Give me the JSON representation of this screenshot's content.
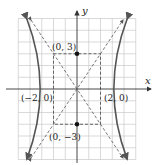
{
  "diagram": {
    "type": "hyperbola",
    "equation": "x^2/4 - y^2/9 = 1",
    "axes": {
      "x_label": "x",
      "y_label": "y",
      "x_range": [
        -5,
        5
      ],
      "y_range": [
        -6,
        6
      ],
      "grid": true
    },
    "points": [
      {
        "label": "(0, 3)",
        "x": 0,
        "y": 3,
        "filled": true
      },
      {
        "label": "(0, −3)",
        "x": 0,
        "y": -3,
        "filled": true
      },
      {
        "label": "(−2, 0)",
        "x": -2,
        "y": 0,
        "filled": false
      },
      {
        "label": "(2, 0)",
        "x": 2,
        "y": 0,
        "filled": false
      }
    ],
    "asymptotes": [
      "y = 1.5x",
      "y = -1.5x"
    ],
    "fundamental_rectangle": {
      "x": [
        -2,
        2
      ],
      "y": [
        -3,
        3
      ]
    },
    "colors": {
      "grid": "#c8c8c8",
      "axis": "#333333",
      "curve": "#555555",
      "dashed": "#444444",
      "point": "#111111"
    }
  }
}
